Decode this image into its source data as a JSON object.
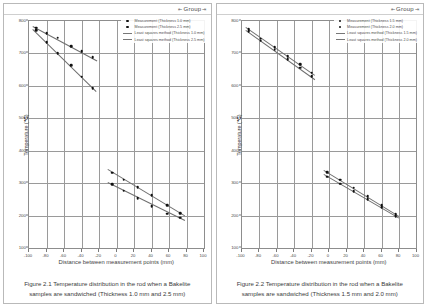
{
  "charts": [
    {
      "group_label": "Group",
      "caption": "Figure 2.1 Temperature distribution in the rod when a Bakelite samples are sandwiched (Thickness 1.0 mm and 2.5 mm)",
      "legend": [
        {
          "marker": "dot",
          "label": "Measurement (Thickness 1.0 mm)"
        },
        {
          "marker": "dot",
          "label": "Measurement (Thickness 2.5 mm)"
        },
        {
          "marker": "line",
          "label": "Least squares method (Thickness 1.0 mm)"
        },
        {
          "marker": "line",
          "label": "Least squares method (Thickness 2.5 mm)"
        }
      ],
      "chart_data": {
        "type": "scatter",
        "title": "",
        "xlabel": "Distance between measurement points (mm)",
        "ylabel": "Temperature (℃)",
        "xlim": [
          -100,
          100
        ],
        "ylim": [
          100,
          800
        ],
        "xticks": [
          -100,
          -80,
          -60,
          -40,
          -20,
          0,
          20,
          40,
          60,
          80,
          100
        ],
        "yticks": [
          100,
          200,
          300,
          400,
          500,
          600,
          700,
          800
        ],
        "grid": true,
        "legend_position": "top-right",
        "series": [
          {
            "name": "Measurement (Thickness 1.0 mm)",
            "marker": "dot",
            "points": [
              {
                "x": -92,
                "y": 779
              },
              {
                "x": -80,
                "y": 762
              },
              {
                "x": -67,
                "y": 749
              },
              {
                "x": -52,
                "y": 723
              },
              {
                "x": -40,
                "y": 706
              },
              {
                "x": -27,
                "y": 689
              },
              {
                "x": -5,
                "y": 332
              },
              {
                "x": 8,
                "y": 310
              },
              {
                "x": 24,
                "y": 288
              },
              {
                "x": 40,
                "y": 262
              },
              {
                "x": 58,
                "y": 232
              },
              {
                "x": 73,
                "y": 207
              }
            ]
          },
          {
            "name": "Measurement (Thickness 2.5 mm)",
            "marker": "dot",
            "points": [
              {
                "x": -92,
                "y": 771
              },
              {
                "x": -80,
                "y": 735
              },
              {
                "x": -67,
                "y": 700
              },
              {
                "x": -52,
                "y": 663
              },
              {
                "x": -40,
                "y": 628
              },
              {
                "x": -27,
                "y": 593
              },
              {
                "x": -5,
                "y": 297
              },
              {
                "x": 8,
                "y": 277
              },
              {
                "x": 24,
                "y": 253
              },
              {
                "x": 40,
                "y": 229
              },
              {
                "x": 58,
                "y": 206
              },
              {
                "x": 73,
                "y": 194
              }
            ]
          }
        ],
        "fits": [
          {
            "name": "Least squares method (Thickness 1.0 mm)",
            "x1": -95,
            "y1": 786,
            "x2": -22,
            "y2": 680
          },
          {
            "name": "Least squares method (Thickness 2.5 mm)",
            "x1": -95,
            "y1": 776,
            "x2": -22,
            "y2": 583
          },
          {
            "name": "Least squares method (Thickness 1.0 mm)",
            "x1": -10,
            "y1": 343,
            "x2": 78,
            "y2": 200
          },
          {
            "name": "Least squares method (Thickness 2.5 mm)",
            "x1": -10,
            "y1": 305,
            "x2": 78,
            "y2": 188
          }
        ]
      }
    },
    {
      "group_label": "Group",
      "caption": "Figure 2.2 Temperature distribution in the rod when a Bakelite samples are sandwiched (Thickness 1.5 mm and 2.0 mm)",
      "legend": [
        {
          "marker": "dot",
          "label": "Measurement (Thickness 1.5 mm)"
        },
        {
          "marker": "dot",
          "label": "Measurement (Thickness 2.0 mm)"
        },
        {
          "marker": "line",
          "label": "Least squares method (Thickness 1.5 mm)"
        },
        {
          "marker": "line",
          "label": "Least squares method (Thickness 2.0 mm)"
        }
      ],
      "chart_data": {
        "type": "scatter",
        "title": "",
        "xlabel": "Distance between measurement points (mm)",
        "ylabel": "Temperature (℃)",
        "xlim": [
          -100,
          100
        ],
        "ylim": [
          100,
          800
        ],
        "xticks": [
          -100,
          -80,
          -60,
          -40,
          -20,
          0,
          20,
          40,
          60,
          80,
          100
        ],
        "yticks": [
          100,
          200,
          300,
          400,
          500,
          600,
          700,
          800
        ],
        "grid": true,
        "legend_position": "top-right",
        "series": [
          {
            "name": "Measurement (Thickness 1.5 mm)",
            "marker": "dot",
            "points": [
              {
                "x": -92,
                "y": 775
              },
              {
                "x": -78,
                "y": 745
              },
              {
                "x": -62,
                "y": 719
              },
              {
                "x": -47,
                "y": 692
              },
              {
                "x": -33,
                "y": 666
              },
              {
                "x": -20,
                "y": 641
              },
              {
                "x": -2,
                "y": 333
              },
              {
                "x": 13,
                "y": 310
              },
              {
                "x": 28,
                "y": 286
              },
              {
                "x": 44,
                "y": 259
              },
              {
                "x": 60,
                "y": 232
              },
              {
                "x": 76,
                "y": 204
              }
            ]
          },
          {
            "name": "Measurement (Thickness 2.0 mm)",
            "marker": "dot",
            "points": [
              {
                "x": -92,
                "y": 769
              },
              {
                "x": -78,
                "y": 739
              },
              {
                "x": -62,
                "y": 711
              },
              {
                "x": -47,
                "y": 683
              },
              {
                "x": -33,
                "y": 656
              },
              {
                "x": -20,
                "y": 629
              },
              {
                "x": -2,
                "y": 320
              },
              {
                "x": 13,
                "y": 298
              },
              {
                "x": 28,
                "y": 275
              },
              {
                "x": 44,
                "y": 250
              },
              {
                "x": 60,
                "y": 226
              },
              {
                "x": 76,
                "y": 198
              }
            ]
          }
        ],
        "fits": [
          {
            "name": "Least squares method (Thickness 1.5 mm)",
            "x1": -95,
            "y1": 780,
            "x2": -16,
            "y2": 632
          },
          {
            "name": "Least squares method (Thickness 2.0 mm)",
            "x1": -95,
            "y1": 772,
            "x2": -16,
            "y2": 620
          },
          {
            "name": "Least squares method (Thickness 1.5 mm)",
            "x1": -6,
            "y1": 340,
            "x2": 80,
            "y2": 198
          },
          {
            "name": "Least squares method (Thickness 2.0 mm)",
            "x1": -6,
            "y1": 327,
            "x2": 80,
            "y2": 192
          }
        ]
      }
    }
  ]
}
